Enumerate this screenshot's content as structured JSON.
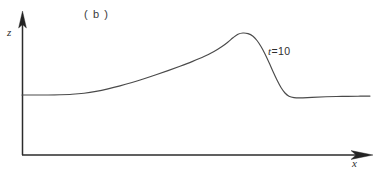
{
  "figure": {
    "panel_label": "( b )",
    "background_color": "#ffffff",
    "ink_color": "#2b2b2b",
    "curve_color": "#4a4a4a",
    "annotation": {
      "variable": "t",
      "rest": "=10",
      "full": "t=10"
    },
    "axes": {
      "y_label": "z",
      "x_label": "x",
      "origin_px": {
        "x": 22,
        "y": 155
      },
      "y_axis_top_px": 12,
      "x_axis_right_px": 372,
      "arrowheads": "filled-triangle"
    }
  },
  "chart_data": {
    "type": "line",
    "title": "( b )",
    "xlabel": "x",
    "ylabel": "z",
    "grid": false,
    "legend": null,
    "annotations": [
      {
        "text": "t=10",
        "x_px": 268,
        "y_px": 46,
        "describes": "solitary wave profile at time t = 10"
      }
    ],
    "axis_style": "arrow-terminated, unlabeled ticks",
    "xlim_px": [
      22,
      372
    ],
    "ylim_px": [
      155,
      12
    ],
    "baseline_level_px": 95,
    "series": [
      {
        "name": "z(x) at t=10",
        "description": "Flat upstream level, gradual rise to a rounded crest, steep downstream drop with slight undershoot, then flat downstream level slightly below the upstream level.",
        "points_px": [
          [
            22,
            95.0
          ],
          [
            35,
            95.0
          ],
          [
            48,
            95.0
          ],
          [
            60,
            94.8
          ],
          [
            72,
            94.3
          ],
          [
            84,
            93.2
          ],
          [
            96,
            91.4
          ],
          [
            108,
            88.9
          ],
          [
            120,
            85.9
          ],
          [
            132,
            82.5
          ],
          [
            144,
            78.8
          ],
          [
            156,
            74.8
          ],
          [
            168,
            70.6
          ],
          [
            180,
            66.2
          ],
          [
            192,
            61.6
          ],
          [
            204,
            56.6
          ],
          [
            214,
            51.5
          ],
          [
            222,
            46.5
          ],
          [
            228,
            42.0
          ],
          [
            233,
            37.8
          ],
          [
            238,
            34.2
          ],
          [
            243,
            33.0
          ],
          [
            248,
            33.6
          ],
          [
            253,
            36.2
          ],
          [
            257,
            40.5
          ],
          [
            261,
            46.5
          ],
          [
            265,
            54.0
          ],
          [
            269,
            62.5
          ],
          [
            273,
            71.5
          ],
          [
            277,
            80.0
          ],
          [
            281,
            87.5
          ],
          [
            285,
            93.0
          ],
          [
            289,
            96.2
          ],
          [
            294,
            97.6
          ],
          [
            300,
            97.9
          ],
          [
            312,
            97.4
          ],
          [
            326,
            96.8
          ],
          [
            342,
            96.4
          ],
          [
            358,
            96.2
          ],
          [
            370,
            96.1
          ]
        ]
      }
    ]
  }
}
